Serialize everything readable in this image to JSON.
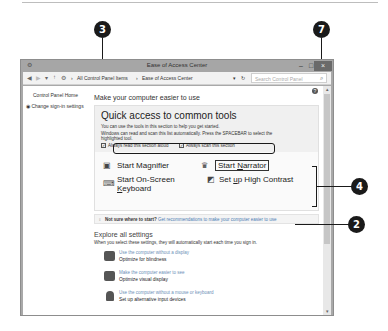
{
  "window": {
    "title": "Ease of Access Center",
    "buttons": {
      "minimize": "–",
      "maximize": "□",
      "close": "×"
    }
  },
  "addressbar": {
    "back": "◀",
    "forward": "▶",
    "recent": "▾",
    "up": "↑",
    "breadcrumb": [
      "All Control Panel Items",
      "Ease of Access Center"
    ],
    "separator": "›",
    "dropdown": "▾",
    "refresh": "↻",
    "search_placeholder": "Search Control Panel",
    "search_icon": "⌕"
  },
  "sidebar": {
    "items": [
      {
        "label": "Control Panel Home"
      },
      {
        "label": "Change sign-in settings",
        "icon": "shield-icon"
      }
    ]
  },
  "main": {
    "help": "?",
    "title": "Make your computer easier to use",
    "quick_access": {
      "heading": "Quick access to common tools",
      "desc1": "You can use the tools in this section to help you get started.",
      "desc2": "Windows can read and scan this list automatically.  Press the SPACEBAR to select the",
      "desc3": "highlighted tool.",
      "checkboxes": [
        {
          "label": "Always read this section aloud",
          "checked": true
        },
        {
          "label": "Always scan this section",
          "checked": true
        }
      ],
      "tools": [
        {
          "label": "Start Magnifier",
          "icon": "magnifier-icon"
        },
        {
          "label_pre": "Start ",
          "label_u": "N",
          "label_post": "arrator",
          "icon": "narrator-icon",
          "focused": true
        },
        {
          "label_line1": "Start On-Screen",
          "label_line2_u": "K",
          "label_line2": "eyboard",
          "icon": "keyboard-icon"
        },
        {
          "label_pre": "Set ",
          "label_u": "u",
          "label_post": "p High Contrast",
          "icon": "contrast-icon"
        }
      ]
    },
    "tip": {
      "bold": "Not sure where to start?",
      "link": "Get recommendations to make your computer easier to use"
    },
    "explore": {
      "title": "Explore all settings",
      "desc": "When you select these settings, they will automatically start each time you sign in.",
      "settings": [
        {
          "sub": "Use the computer without a display",
          "main": "Optimize for blindness"
        },
        {
          "sub": "Make the computer easier to see",
          "main": "Optimize visual display"
        },
        {
          "sub": "Use the computer without a mouse or keyboard",
          "main": "Set up alternative input devices"
        }
      ]
    }
  },
  "callouts": [
    "3",
    "7",
    "4",
    "2"
  ]
}
